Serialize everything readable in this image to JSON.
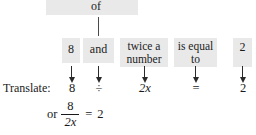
{
  "diagram": {
    "title_phrase": "of",
    "phrase_boxes": [
      {
        "id": "eight",
        "text": "8"
      },
      {
        "id": "and",
        "text": "and"
      },
      {
        "id": "twice-a-number",
        "line1": "twice a",
        "line2": "number"
      },
      {
        "id": "is-equal-to",
        "line1": "is equal",
        "line2": "to"
      },
      {
        "id": "two",
        "text": "2"
      }
    ],
    "translate_label": "Translate:",
    "translated_terms": [
      {
        "id": "eight",
        "text": "8"
      },
      {
        "id": "divide",
        "text": "÷"
      },
      {
        "id": "two-x",
        "text": "2x"
      },
      {
        "id": "equals",
        "text": "="
      },
      {
        "id": "two",
        "text": "2"
      }
    ],
    "alternate_form": {
      "or_word": "or",
      "numerator": "8",
      "denominator": "2x",
      "equals": "=",
      "right_side": "2"
    },
    "colors": {
      "highlight": "#e9e9e9",
      "text": "#1a1a1a",
      "arrow": "#2a2a2a"
    }
  }
}
